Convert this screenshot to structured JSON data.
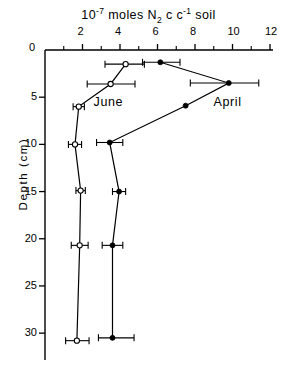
{
  "chart_data": {
    "type": "line",
    "title_parts": {
      "base": "10",
      "exponent": "-7",
      "mid": " moles N",
      "subscript": "2",
      "unit": " c c",
      "unit_exponent": "-1",
      "tail": " soil"
    },
    "xlabel": "10-7 moles N2 cc-1 soil",
    "ylabel": "Depth (cm)",
    "xlim": [
      0,
      12
    ],
    "ylim": [
      0,
      32
    ],
    "y_inverted": true,
    "x_axis_position": "top",
    "grid": false,
    "legend_position": "inline-annotation",
    "x_ticks_major": [
      0,
      2,
      4,
      6,
      8,
      10,
      12
    ],
    "x_ticks_minor": [
      1,
      3,
      5,
      7,
      9,
      11
    ],
    "x_tick_labels": [
      "0",
      "2",
      "4",
      "6",
      "8",
      "10",
      "12"
    ],
    "y_ticks_major": [
      0,
      5,
      10,
      15,
      20,
      25,
      30
    ],
    "y_tick_labels": [
      "0",
      "5",
      "10",
      "15",
      "20",
      "25",
      "30"
    ],
    "series": [
      {
        "name": "April",
        "marker": "filled-circle",
        "label_x": 9.95,
        "label_y": 5.6,
        "points": [
          {
            "x": 6.15,
            "y": 1.3,
            "xerr_low": 0.95,
            "xerr_high": 1.05
          },
          {
            "x": 9.8,
            "y": 3.5,
            "xerr_low": 2.05,
            "xerr_high": 1.6
          },
          {
            "x": 7.5,
            "y": 5.9,
            "xerr_low": 0.0,
            "xerr_high": 0.0
          },
          {
            "x": 3.45,
            "y": 9.8,
            "xerr_low": 0.7,
            "xerr_high": 0.7
          },
          {
            "x": 3.95,
            "y": 15.0,
            "xerr_low": 0.35,
            "xerr_high": 0.35
          },
          {
            "x": 3.6,
            "y": 20.7,
            "xerr_low": 0.55,
            "xerr_high": 0.55
          },
          {
            "x": 3.6,
            "y": 30.5,
            "xerr_low": 0.75,
            "xerr_high": 1.15
          }
        ]
      },
      {
        "name": "June",
        "marker": "open-circle",
        "label_x": 3.55,
        "label_y": 5.6,
        "points": [
          {
            "x": 4.3,
            "y": 1.5,
            "xerr_low": 1.1,
            "xerr_high": 1.0
          },
          {
            "x": 3.5,
            "y": 3.6,
            "xerr_low": 1.25,
            "xerr_high": 1.3
          },
          {
            "x": 1.8,
            "y": 6.0,
            "xerr_low": 0.3,
            "xerr_high": 0.3
          },
          {
            "x": 1.6,
            "y": 10.0,
            "xerr_low": 0.35,
            "xerr_high": 0.35
          },
          {
            "x": 1.9,
            "y": 14.9,
            "xerr_low": 0.25,
            "xerr_high": 0.25
          },
          {
            "x": 1.85,
            "y": 20.7,
            "xerr_low": 0.45,
            "xerr_high": 0.45
          },
          {
            "x": 1.7,
            "y": 30.8,
            "xerr_low": 0.6,
            "xerr_high": 0.65
          }
        ]
      }
    ],
    "colors": {
      "axis": "#000000",
      "line": "#000000",
      "marker_fill_april": "#000000",
      "marker_fill_june": "#ffffff",
      "background": "#ffffff"
    }
  },
  "annotations": {
    "april_label": "April",
    "june_label": "June"
  }
}
